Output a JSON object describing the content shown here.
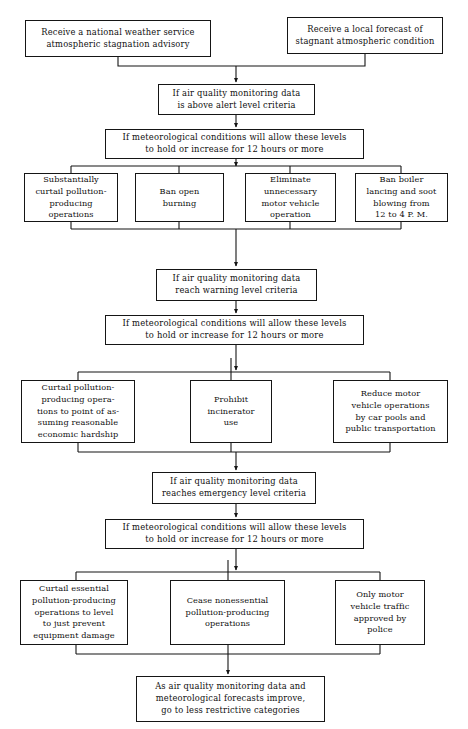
{
  "diagram": {
    "line_color": "#151515",
    "background": "#ffffff",
    "text_color": "#101010"
  },
  "nodes": {
    "trigger_national": {
      "text": "Receive a national weather service\natmospheric stagnation advisory",
      "x": 25,
      "y": 20,
      "w": 186,
      "h": 37
    },
    "trigger_local": {
      "text": "Receive a local forecast of\nstagnant atmospheric condition",
      "x": 287,
      "y": 17,
      "w": 156,
      "h": 37
    },
    "alert_criteria": {
      "text": "If air quality monitoring data\nis above alert level criteria",
      "x": 158,
      "y": 84,
      "w": 157,
      "h": 31
    },
    "alert_meteorology": {
      "text": "If meteorological conditions will allow these levels\nto hold or increase for 12 hours or more",
      "x": 105,
      "y": 129,
      "w": 259,
      "h": 30
    },
    "alert_action_1": {
      "text": "Substantially\ncurtail pollution-\nproducing\noperations",
      "x": 24,
      "y": 173,
      "w": 94,
      "h": 49
    },
    "alert_action_2": {
      "text": "Ban open\nburning",
      "x": 135,
      "y": 173,
      "w": 89,
      "h": 49
    },
    "alert_action_3": {
      "text": "Eliminate\nunnecessary\nmotor vehicle\noperation",
      "x": 245,
      "y": 173,
      "w": 91,
      "h": 49
    },
    "alert_action_4": {
      "text": "Ban boiler\nlancing and soot\nblowing from\n12 to 4 P. M.",
      "x": 355,
      "y": 173,
      "w": 93,
      "h": 49
    },
    "warning_criteria": {
      "text": "If air quality monitoring data\nreach warning level criteria",
      "x": 156,
      "y": 269,
      "w": 161,
      "h": 32
    },
    "warning_meteorology": {
      "text": "If meteorological conditions will allow these levels\nto hold or increase for 12 hours or more",
      "x": 105,
      "y": 315,
      "w": 259,
      "h": 30
    },
    "warning_action_1": {
      "text": "Curtail pollution-\nproducing opera-\ntions to point of as-\nsuming reasonable\neconomic hardship",
      "x": 21,
      "y": 380,
      "w": 114,
      "h": 63
    },
    "warning_action_2": {
      "text": "Prohibit\nincinerator\nuse",
      "x": 190,
      "y": 380,
      "w": 82,
      "h": 63
    },
    "warning_action_3": {
      "text": "Reduce motor\nvehicle operations\nby car pools and\npublic transportation",
      "x": 333,
      "y": 380,
      "w": 115,
      "h": 63
    },
    "emergency_criteria": {
      "text": "If air quality monitoring data\nreaches emergency level criteria",
      "x": 152,
      "y": 472,
      "w": 164,
      "h": 32
    },
    "emergency_meteorology": {
      "text": "If meteorological conditions will allow these levels\nto hold or increase for 12 hours or more",
      "x": 105,
      "y": 519,
      "w": 259,
      "h": 30
    },
    "emergency_action_1": {
      "text": "Curtail essential\npollution-producing\noperations to level\nto just prevent\nequipment damage",
      "x": 20,
      "y": 580,
      "w": 108,
      "h": 65
    },
    "emergency_action_2": {
      "text": "Cease nonessential\npollution-producing\noperations",
      "x": 170,
      "y": 580,
      "w": 115,
      "h": 65
    },
    "emergency_action_3": {
      "text": "Only motor\nvehicle traffic\napproved by\npolice",
      "x": 335,
      "y": 580,
      "w": 90,
      "h": 65
    },
    "recovery": {
      "text": "As air quality monitoring data and\nmeteorological forecasts improve,\ngo to less restrictive categories",
      "x": 136,
      "y": 676,
      "w": 189,
      "h": 46
    }
  }
}
